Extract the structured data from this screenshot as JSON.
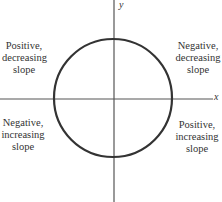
{
  "axes": {
    "x_label": "x",
    "y_label": "y",
    "color": "#555555"
  },
  "circle": {
    "stroke": "#333333",
    "cx": 113,
    "cy": 98,
    "r": 59
  },
  "quadrants": {
    "top_left": {
      "line1": "Positive,",
      "line2": "decreasing",
      "line3": "slope"
    },
    "top_right": {
      "line1": "Negative,",
      "line2": "decreasing",
      "line3": "slope"
    },
    "bottom_left": {
      "line1": "Negative,",
      "line2": "increasing",
      "line3": "slope"
    },
    "bottom_right": {
      "line1": "Positive,",
      "line2": "increasing",
      "line3": "slope"
    }
  }
}
